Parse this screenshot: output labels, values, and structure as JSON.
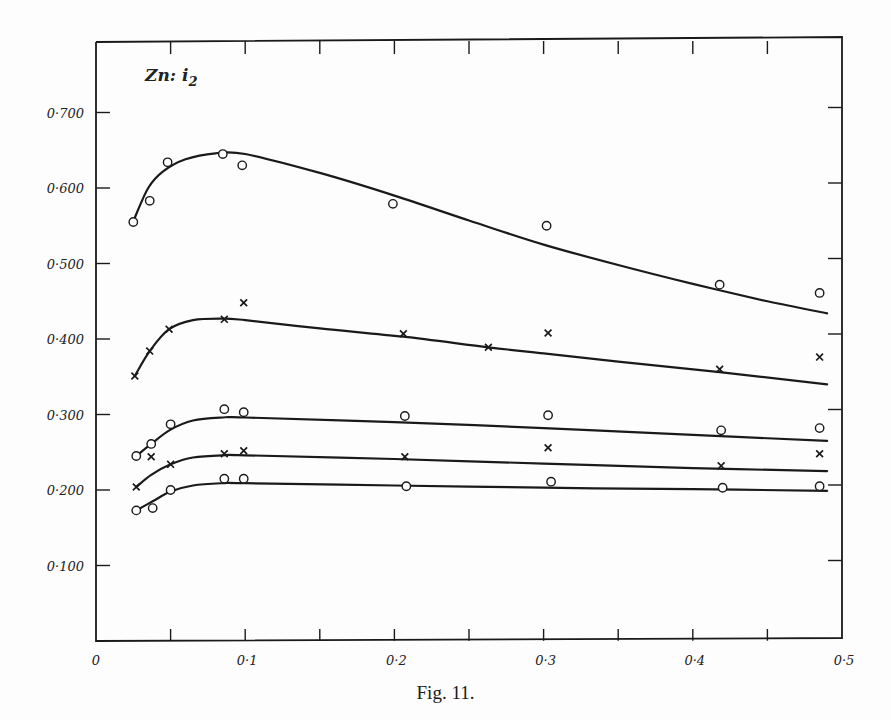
{
  "figure": {
    "caption": "Fig. 11.",
    "panel_label": "Zn: i",
    "panel_label_sub": "2",
    "ink_color": "#1a1a1a",
    "background": "#fdfdfd"
  },
  "chart_data": {
    "type": "line",
    "xlabel": "",
    "ylabel": "",
    "xlim": [
      0,
      0.5
    ],
    "ylim": [
      0,
      0.78
    ],
    "grid": false,
    "legend": null,
    "x_ticks": [
      0,
      0.05,
      0.1,
      0.15,
      0.2,
      0.25,
      0.3,
      0.35,
      0.4,
      0.45,
      0.5
    ],
    "x_tick_labels": [
      {
        "value": 0,
        "label": "0"
      },
      {
        "value": 0.1,
        "label": "0·1"
      },
      {
        "value": 0.2,
        "label": "0·2"
      },
      {
        "value": 0.3,
        "label": "0·3"
      },
      {
        "value": 0.4,
        "label": "0·4"
      },
      {
        "value": 0.5,
        "label": "0·5"
      }
    ],
    "y_tick_labels": [
      {
        "value": 0.1,
        "label": "0·100"
      },
      {
        "value": 0.2,
        "label": "0·200"
      },
      {
        "value": 0.3,
        "label": "0·300"
      },
      {
        "value": 0.4,
        "label": "0·400"
      },
      {
        "value": 0.5,
        "label": "0·500"
      },
      {
        "value": 0.6,
        "label": "0·600"
      },
      {
        "value": 0.7,
        "label": "0·700"
      }
    ],
    "series": [
      {
        "name": "series-1",
        "marker": "circle",
        "x": [
          0.025,
          0.036,
          0.048,
          0.085,
          0.098,
          0.199,
          0.302,
          0.418,
          0.485
        ],
        "y": [
          0.555,
          0.583,
          0.634,
          0.645,
          0.63,
          0.579,
          0.55,
          0.472,
          0.461
        ],
        "fit_curve": [
          [
            0.025,
            0.556
          ],
          [
            0.035,
            0.6
          ],
          [
            0.045,
            0.622
          ],
          [
            0.06,
            0.638
          ],
          [
            0.08,
            0.646
          ],
          [
            0.1,
            0.645
          ],
          [
            0.15,
            0.62
          ],
          [
            0.2,
            0.59
          ],
          [
            0.25,
            0.557
          ],
          [
            0.3,
            0.525
          ],
          [
            0.35,
            0.498
          ],
          [
            0.4,
            0.473
          ],
          [
            0.45,
            0.45
          ],
          [
            0.49,
            0.434
          ]
        ]
      },
      {
        "name": "series-2",
        "marker": "cross",
        "x": [
          0.026,
          0.036,
          0.049,
          0.086,
          0.099,
          0.206,
          0.263,
          0.303,
          0.418,
          0.485
        ],
        "y": [
          0.351,
          0.384,
          0.413,
          0.426,
          0.448,
          0.407,
          0.389,
          0.408,
          0.36,
          0.376
        ],
        "fit_curve": [
          [
            0.026,
            0.351
          ],
          [
            0.036,
            0.384
          ],
          [
            0.049,
            0.413
          ],
          [
            0.065,
            0.425
          ],
          [
            0.085,
            0.427
          ],
          [
            0.1,
            0.425
          ],
          [
            0.15,
            0.414
          ],
          [
            0.206,
            0.403
          ],
          [
            0.263,
            0.389
          ],
          [
            0.3,
            0.381
          ],
          [
            0.35,
            0.37
          ],
          [
            0.418,
            0.356
          ],
          [
            0.49,
            0.34
          ]
        ]
      },
      {
        "name": "series-3",
        "marker": "circle",
        "x": [
          0.027,
          0.037,
          0.05,
          0.086,
          0.099,
          0.207,
          0.303,
          0.419,
          0.485
        ],
        "y": [
          0.245,
          0.261,
          0.287,
          0.307,
          0.303,
          0.298,
          0.299,
          0.279,
          0.282
        ],
        "fit_curve": [
          [
            0.027,
            0.245
          ],
          [
            0.037,
            0.261
          ],
          [
            0.05,
            0.28
          ],
          [
            0.065,
            0.292
          ],
          [
            0.085,
            0.296
          ],
          [
            0.1,
            0.296
          ],
          [
            0.2,
            0.29
          ],
          [
            0.3,
            0.282
          ],
          [
            0.4,
            0.273
          ],
          [
            0.49,
            0.265
          ]
        ]
      },
      {
        "name": "series-4",
        "marker": "cross",
        "x": [
          0.027,
          0.037,
          0.05,
          0.086,
          0.099,
          0.207,
          0.303,
          0.419,
          0.485
        ],
        "y": [
          0.204,
          0.244,
          0.234,
          0.248,
          0.252,
          0.244,
          0.256,
          0.232,
          0.248
        ],
        "fit_curve": [
          [
            0.027,
            0.204
          ],
          [
            0.037,
            0.22
          ],
          [
            0.05,
            0.234
          ],
          [
            0.065,
            0.243
          ],
          [
            0.085,
            0.246
          ],
          [
            0.1,
            0.246
          ],
          [
            0.2,
            0.241
          ],
          [
            0.3,
            0.235
          ],
          [
            0.4,
            0.229
          ],
          [
            0.49,
            0.225
          ]
        ]
      },
      {
        "name": "series-5",
        "marker": "circle",
        "x": [
          0.027,
          0.038,
          0.05,
          0.086,
          0.099,
          0.208,
          0.305,
          0.42,
          0.485
        ],
        "y": [
          0.173,
          0.176,
          0.2,
          0.215,
          0.215,
          0.205,
          0.211,
          0.203,
          0.205
        ],
        "fit_curve": [
          [
            0.027,
            0.173
          ],
          [
            0.038,
            0.185
          ],
          [
            0.05,
            0.198
          ],
          [
            0.065,
            0.206
          ],
          [
            0.085,
            0.209
          ],
          [
            0.1,
            0.209
          ],
          [
            0.2,
            0.206
          ],
          [
            0.3,
            0.203
          ],
          [
            0.4,
            0.201
          ],
          [
            0.49,
            0.199
          ]
        ]
      }
    ]
  }
}
